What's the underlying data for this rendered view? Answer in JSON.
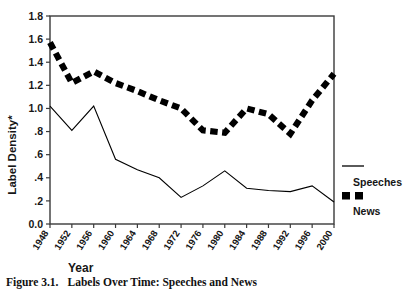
{
  "figure": {
    "caption_number": "Figure 3.1.",
    "caption_text": "Labels Over Time: Speeches and News"
  },
  "chart_data": {
    "type": "line",
    "title": "",
    "xlabel": "Year",
    "ylabel": "Label Density*",
    "xlim": [
      1948,
      2000
    ],
    "ylim": [
      0.0,
      1.8
    ],
    "grid": false,
    "legend_position": "right",
    "categories": [
      1948,
      1952,
      1956,
      1960,
      1964,
      1968,
      1972,
      1976,
      1980,
      1984,
      1988,
      1992,
      1996,
      2000
    ],
    "xticklabels": [
      "1948",
      "1952",
      "1956",
      "1960",
      "1964",
      "1968",
      "1972",
      "1976",
      "1980",
      "1984",
      "1988",
      "1992",
      "1996",
      "2000"
    ],
    "yticks": [
      0.0,
      0.2,
      0.4,
      0.6,
      0.8,
      1.0,
      1.2,
      1.4,
      1.6,
      1.8
    ],
    "yticklabels": [
      "0.0",
      ".2",
      ".4",
      ".6",
      ".8",
      "1.0",
      "1.2",
      "1.4",
      "1.6",
      "1.8"
    ],
    "series": [
      {
        "name": "Speeches",
        "style": "solid",
        "values": [
          1.02,
          0.81,
          1.02,
          0.56,
          0.47,
          0.4,
          0.23,
          0.33,
          0.46,
          0.31,
          0.29,
          0.28,
          0.33,
          0.19
        ]
      },
      {
        "name": "News",
        "style": "dashed",
        "values": [
          1.57,
          1.22,
          1.32,
          1.22,
          1.15,
          1.07,
          1.0,
          0.81,
          0.79,
          1.0,
          0.95,
          0.78,
          1.07,
          1.3
        ]
      }
    ]
  },
  "legend": {
    "items": [
      {
        "label": "Speeches",
        "marker": "solid-line"
      },
      {
        "label": "News",
        "marker": "dashed-squares"
      }
    ]
  },
  "colors": {
    "line": "#000000",
    "axis": "#3a3a3a",
    "background": "#ffffff"
  }
}
